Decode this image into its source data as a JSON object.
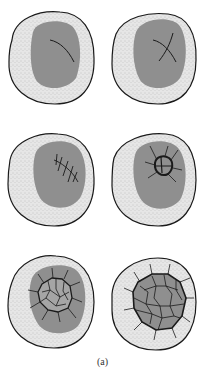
{
  "figure": {
    "caption": "(a)",
    "stages": [
      {
        "id": 1,
        "pattern": "single-curved-crack"
      },
      {
        "id": 2,
        "pattern": "crossed-cracks"
      },
      {
        "id": 3,
        "pattern": "parallel-cracks-with-cross-hatches"
      },
      {
        "id": 4,
        "pattern": "small-cellular-network"
      },
      {
        "id": 5,
        "pattern": "expanded-cellular-network-in-core"
      },
      {
        "id": 6,
        "pattern": "full-cellular-network-core-replaced"
      }
    ],
    "colors": {
      "outline": "#1a1a1a",
      "rim": "#e4e4e4",
      "core": "#8f8f8f",
      "crack": "#1a1a1a",
      "background": "#ffffff"
    }
  }
}
